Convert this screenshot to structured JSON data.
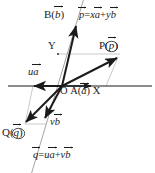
{
  "figure": {
    "type": "vector-decomposition-diagram",
    "background": "#ffffff",
    "stroke_dark": "#1b1b1b",
    "stroke_light": "#b9b9b9",
    "axes": {
      "x_axis_label": "X",
      "y_axis_label": "Y",
      "origin_label": "O"
    },
    "labels": {
      "point_B": "B(",
      "point_B_vec": "b",
      "point_B_close": ")",
      "point_A": "A(",
      "point_A_vec": "a",
      "point_A_close": ")",
      "point_P": "P(",
      "point_P_vec": "p",
      "point_P_close": ")",
      "point_Q": "Q(",
      "point_Q_vec": "q",
      "point_Q_close": ")",
      "origin": "O",
      "axis_x": "X",
      "axis_y": "Y",
      "u_times_a_coef": "u",
      "u_times_a_vec": "a",
      "v_times_b_coef": "v",
      "v_times_b_vec": "b"
    },
    "equations": {
      "p_lhs_vec": "p",
      "p_eq": "=",
      "p_term1_coef": "x",
      "p_term1_vec": "a",
      "p_plus": "+",
      "p_term2_coef": "y",
      "p_term2_vec": "b",
      "q_dash": "",
      "q_lhs_vec": "q",
      "q_eq": "=",
      "q_term1_coef": "u",
      "q_term1_vec": "a",
      "q_plus": "+",
      "q_term2_coef": "v",
      "q_term2_vec": "b"
    },
    "geometry": {
      "origin": [
        62,
        86
      ],
      "x_axis": [
        [
          10,
          86
        ],
        [
          150,
          86
        ]
      ],
      "b_line": [
        [
          82,
          0
        ],
        [
          33,
          173
        ]
      ],
      "point_A_on_axis": [
        88,
        86
      ],
      "point_Y_on_b_line": [
        58,
        54
      ],
      "point_P": [
        118,
        57
      ],
      "point_Q": [
        25,
        124
      ],
      "ua_arrow_end": [
        33,
        86
      ],
      "vb_arrow_end": [
        44,
        120
      ],
      "b_arrow_end": [
        75,
        25
      ]
    }
  }
}
